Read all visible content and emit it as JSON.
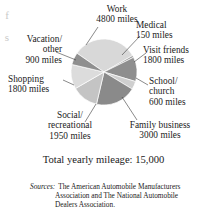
{
  "figure": {
    "edge_ghost_glyphs": "f\ns",
    "total_label": "Total yearly mileage:  15,000",
    "sources": {
      "label": "Sources:",
      "lines": [
        "The American Automobile Manufacturers",
        "Association and The National Automobile",
        "Dealers Association."
      ]
    }
  },
  "chart_data": {
    "type": "pie",
    "title": "",
    "total_label": "Total yearly mileage:  15,000",
    "total_value": 15000,
    "unit": "miles",
    "legend": "none",
    "grid": false,
    "categories": [
      "Work",
      "Medical",
      "Visit friends",
      "School/church",
      "Family business",
      "Social/recreational",
      "Shopping",
      "Vacation/other"
    ],
    "values": [
      4800,
      150,
      1800,
      600,
      3000,
      1950,
      1800,
      900
    ],
    "colors": [
      "#d8d8d8",
      "#9a9a9a",
      "#8e8e8e",
      "#cfcfcf",
      "#8a8a8a",
      "#c4c4c4",
      "#dcdcdc",
      "#8f8f8f"
    ],
    "slices": [
      {
        "name": "Work",
        "value": 4800,
        "value_label": "4800 miles",
        "label_lines": [
          "Work",
          "4800 miles"
        ],
        "color": "#d8d8d8",
        "start_deg": 304.8,
        "end_deg": 420.0
      },
      {
        "name": "Medical",
        "value": 150,
        "value_label": "150 miles",
        "label_lines": [
          "Medical",
          "150 miles"
        ],
        "color": "#9a9a9a",
        "start_deg": 60.0,
        "end_deg": 63.6
      },
      {
        "name": "Visit friends",
        "value": 1800,
        "value_label": "1800 miles",
        "label_lines": [
          "Visit friends",
          "1800 miles"
        ],
        "color": "#8e8e8e",
        "start_deg": 63.6,
        "end_deg": 106.8
      },
      {
        "name": "School/church",
        "value": 600,
        "value_label": "600 miles",
        "label_lines": [
          "School/",
          "church",
          "600 miles"
        ],
        "color": "#cfcfcf",
        "start_deg": 106.8,
        "end_deg": 121.2
      },
      {
        "name": "Family business",
        "value": 3000,
        "value_label": "3000 miles",
        "label_lines": [
          "Family business",
          "3000 miles"
        ],
        "color": "#8a8a8a",
        "start_deg": 121.2,
        "end_deg": 193.2
      },
      {
        "name": "Social/recreational",
        "value": 1950,
        "value_label": "1950 miles",
        "label_lines": [
          "Social/",
          "recreational",
          "1950 miles"
        ],
        "color": "#c4c4c4",
        "start_deg": 193.2,
        "end_deg": 240.0
      },
      {
        "name": "Shopping",
        "value": 1800,
        "value_label": "1800 miles",
        "label_lines": [
          "Shopping",
          "1800 miles"
        ],
        "color": "#dcdcdc",
        "start_deg": 240.0,
        "end_deg": 283.2
      },
      {
        "name": "Vacation/other",
        "value": 900,
        "value_label": "900 miles",
        "label_lines": [
          "Vacation/",
          "other",
          "900 miles"
        ],
        "color": "#8f8f8f",
        "start_deg": 283.2,
        "end_deg": 304.8
      }
    ],
    "geometry": {
      "cx": 104,
      "cy": 72,
      "r": 33
    }
  },
  "labels": {
    "work": {
      "l1": "Work",
      "l2": "4800 miles"
    },
    "medical": {
      "l1": "Medical",
      "l2": "150 miles"
    },
    "friends": {
      "l1": "Visit friends",
      "l2": "1800 miles"
    },
    "school": {
      "l1": "School/",
      "l2": "church",
      "l3": "600 miles"
    },
    "family": {
      "l1": "Family business",
      "l2": "3000 miles"
    },
    "social": {
      "l1": "Social/",
      "l2": "recreational",
      "l3": "1950 miles"
    },
    "shopping": {
      "l1": "Shopping",
      "l2": "1800 miles"
    },
    "vacation": {
      "l1": "Vacation/",
      "l2": "other",
      "l3": "900 miles"
    }
  }
}
